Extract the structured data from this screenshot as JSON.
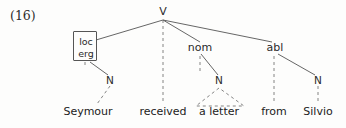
{
  "figure": {
    "example_number": "(16)",
    "type": "syntactic-dependency-tree",
    "sentence": "Seymour received a letter from Silvio"
  },
  "nodes": {
    "root": {
      "label": "V",
      "x": 163,
      "y": 13
    },
    "feature_box": {
      "line1": "loc",
      "line2": "erg"
    },
    "case_nom": {
      "label": "nom",
      "x": 200,
      "y": 50
    },
    "case_abl": {
      "label": "abl",
      "x": 274,
      "y": 50
    },
    "n_left": {
      "label": "N",
      "x": 110,
      "y": 81
    },
    "n_mid": {
      "label": "N",
      "x": 219,
      "y": 81
    },
    "n_right": {
      "label": "N",
      "x": 318,
      "y": 81
    }
  },
  "terminals": [
    {
      "text": "Seymour",
      "x": 88,
      "y": 113
    },
    {
      "text": "received",
      "x": 163,
      "y": 113
    },
    {
      "text": "a letter",
      "x": 219,
      "y": 113
    },
    {
      "text": "from",
      "x": 274,
      "y": 113
    },
    {
      "text": "Silvio",
      "x": 318,
      "y": 113
    }
  ],
  "colors": {
    "ink": "#2a2a2a",
    "line": "#555555",
    "background": "#fdfdfc"
  }
}
